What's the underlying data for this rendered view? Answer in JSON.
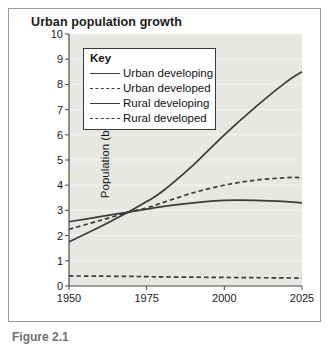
{
  "figure": {
    "title": "Urban population growth",
    "caption": "Figure 2.1"
  },
  "legend": {
    "title": "Key",
    "items": [
      {
        "label": "Urban developing",
        "style": "solid"
      },
      {
        "label": "Urban developed",
        "style": "dashed"
      },
      {
        "label": "Rural developing",
        "style": "solid"
      },
      {
        "label": "Rural developed",
        "style": "dashed"
      }
    ]
  },
  "chart_data": {
    "type": "line",
    "title": "Urban population growth",
    "xlabel": "",
    "ylabel": "Population (billions)",
    "xlim": [
      1950,
      2025
    ],
    "ylim": [
      0,
      10
    ],
    "xticks": [
      1950,
      1975,
      2000,
      2025
    ],
    "yticks": [
      0,
      1,
      2,
      3,
      4,
      5,
      6,
      7,
      8,
      9,
      10
    ],
    "grid": true,
    "legend_position": "upper-left",
    "x": [
      1950,
      1960,
      1970,
      1975,
      1980,
      1990,
      2000,
      2010,
      2020,
      2025
    ],
    "series": [
      {
        "name": "Urban developing",
        "style": "solid",
        "color": "#3b3b3b",
        "values": [
          1.75,
          2.35,
          3.0,
          3.35,
          3.75,
          4.8,
          6.0,
          7.1,
          8.1,
          8.5
        ]
      },
      {
        "name": "Urban developed",
        "style": "dashed",
        "color": "#3b3b3b",
        "values": [
          2.25,
          2.6,
          2.95,
          3.1,
          3.3,
          3.7,
          4.0,
          4.2,
          4.3,
          4.3
        ]
      },
      {
        "name": "Rural developing",
        "style": "solid",
        "color": "#3b3b3b",
        "values": [
          2.55,
          2.75,
          2.95,
          3.05,
          3.15,
          3.3,
          3.4,
          3.4,
          3.35,
          3.3
        ]
      },
      {
        "name": "Rural developed",
        "style": "dashed",
        "color": "#3b3b3b",
        "values": [
          0.4,
          0.39,
          0.38,
          0.37,
          0.36,
          0.35,
          0.34,
          0.33,
          0.32,
          0.31
        ]
      }
    ]
  }
}
